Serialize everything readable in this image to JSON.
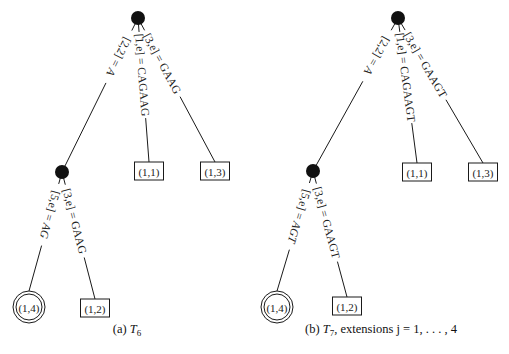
{
  "figure": {
    "panels": [
      {
        "id": "a",
        "caption_prefix": "(a) ",
        "caption_symbol": "T",
        "caption_subscript": "6",
        "caption_suffix": "",
        "root": {
          "x": 138,
          "y": 18
        },
        "internal": {
          "x": 62,
          "y": 172
        },
        "edges": [
          {
            "from": "root",
            "to": "internal",
            "label_pre": "[2,2] = ",
            "label_val": "A",
            "italic_val": true
          },
          {
            "from": "root",
            "to": "leaf_1_1",
            "label_pre": "[1,e] = ",
            "label_val": "CAGAAG",
            "italic_val": false
          },
          {
            "from": "root",
            "to": "leaf_1_3",
            "label_pre": "[3,e] = ",
            "label_val": "GAAG",
            "italic_val": false
          },
          {
            "from": "internal",
            "to": "leaf_1_4",
            "label_pre": "[5,e] = ",
            "label_val": "AG",
            "italic_val": true
          },
          {
            "from": "internal",
            "to": "leaf_1_2",
            "label_pre": "[3,e] = ",
            "label_val": "GAAG",
            "italic_val": false
          }
        ],
        "leaves": {
          "leaf_1_1": {
            "label": "(1,1)",
            "shape": "box",
            "x": 149,
            "y": 171
          },
          "leaf_1_3": {
            "label": "(1,3)",
            "shape": "box",
            "x": 215,
            "y": 171
          },
          "leaf_1_4": {
            "label": "(1,4)",
            "shape": "double-circle",
            "x": 29,
            "y": 307
          },
          "leaf_1_2": {
            "label": "(1,2)",
            "shape": "box",
            "x": 95,
            "y": 308
          }
        },
        "caption_x": 127,
        "caption_y": 333
      },
      {
        "id": "b",
        "caption_prefix": "(b) ",
        "caption_symbol": "T",
        "caption_subscript": "7",
        "caption_suffix": ", extensions j = 1, . . . , 4",
        "root": {
          "x": 398,
          "y": 18
        },
        "internal": {
          "x": 313,
          "y": 171
        },
        "edges": [
          {
            "from": "root",
            "to": "internal",
            "label_pre": "[2,2] = ",
            "label_val": "A",
            "italic_val": true
          },
          {
            "from": "root",
            "to": "leaf_1_1",
            "label_pre": "[1,e] = ",
            "label_val": "CAGAAGT",
            "italic_val": false
          },
          {
            "from": "root",
            "to": "leaf_1_3",
            "label_pre": "[3,e] = ",
            "label_val": "GAAGT",
            "italic_val": false
          },
          {
            "from": "internal",
            "to": "leaf_1_4",
            "label_pre": "[5,e] = ",
            "label_val": "AGT",
            "italic_val": true
          },
          {
            "from": "internal",
            "to": "leaf_1_2",
            "label_pre": "[3,e] = ",
            "label_val": "GAAGT",
            "italic_val": false
          }
        ],
        "leaves": {
          "leaf_1_1": {
            "label": "(1,1)",
            "shape": "box",
            "x": 417,
            "y": 172
          },
          "leaf_1_3": {
            "label": "(1,3)",
            "shape": "box",
            "x": 483,
            "y": 172
          },
          "leaf_1_4": {
            "label": "(1,4)",
            "shape": "double-circle",
            "x": 277,
            "y": 307
          },
          "leaf_1_2": {
            "label": "(1,2)",
            "shape": "box",
            "x": 347,
            "y": 306
          }
        },
        "caption_x": 381,
        "caption_y": 333
      }
    ],
    "colors": {
      "line": "#1a1a1a",
      "node": "#111111",
      "text": "#222222",
      "background": "#ffffff"
    }
  }
}
